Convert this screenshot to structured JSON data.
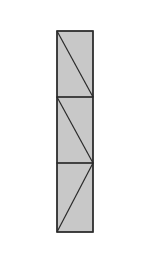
{
  "diagram": {
    "type": "stacked-rectangle-with-diagonals",
    "fill_color": "#c8c8c8",
    "stroke_color": "#2a2a2a",
    "background_color": "#ffffff",
    "outer": {
      "x": 57,
      "y": 31,
      "width": 36,
      "height": 201
    },
    "sections": [
      {
        "y_top": 31,
        "y_bottom": 97,
        "diagonal": "top-left-to-bottom-right"
      },
      {
        "y_top": 97,
        "y_bottom": 163,
        "diagonal": "top-left-to-bottom-right"
      },
      {
        "y_top": 163,
        "y_bottom": 232,
        "diagonal": "top-right-to-bottom-left"
      }
    ]
  }
}
